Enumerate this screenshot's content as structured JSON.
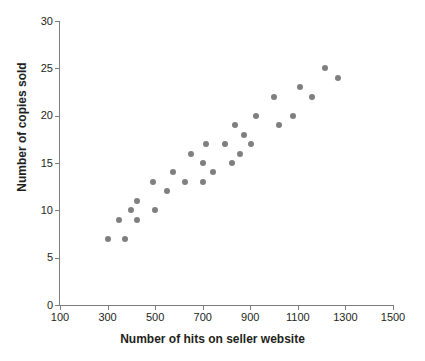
{
  "chart_data": {
    "type": "scatter",
    "title": "",
    "xlabel": "Number of hits on seller website",
    "ylabel": "Number of copies sold",
    "xlim": [
      100,
      1500
    ],
    "ylim": [
      0,
      30
    ],
    "xticks": [
      100,
      300,
      500,
      700,
      900,
      1100,
      1300,
      1500
    ],
    "yticks": [
      0,
      5,
      10,
      15,
      20,
      25,
      30
    ],
    "grid": false,
    "legend": null,
    "marker_color": "#7f7f7f",
    "axis_color": "#7d7d7d",
    "text_color": "#231f20",
    "points": [
      {
        "x": 300,
        "y": 7
      },
      {
        "x": 375,
        "y": 7
      },
      {
        "x": 350,
        "y": 9
      },
      {
        "x": 425,
        "y": 9
      },
      {
        "x": 400,
        "y": 10
      },
      {
        "x": 500,
        "y": 10
      },
      {
        "x": 425,
        "y": 11
      },
      {
        "x": 550,
        "y": 12
      },
      {
        "x": 490,
        "y": 13
      },
      {
        "x": 625,
        "y": 13
      },
      {
        "x": 700,
        "y": 13
      },
      {
        "x": 575,
        "y": 14
      },
      {
        "x": 745,
        "y": 14
      },
      {
        "x": 700,
        "y": 15
      },
      {
        "x": 825,
        "y": 15
      },
      {
        "x": 650,
        "y": 16
      },
      {
        "x": 855,
        "y": 16
      },
      {
        "x": 715,
        "y": 17
      },
      {
        "x": 795,
        "y": 17
      },
      {
        "x": 905,
        "y": 17
      },
      {
        "x": 875,
        "y": 18
      },
      {
        "x": 835,
        "y": 19
      },
      {
        "x": 1020,
        "y": 19
      },
      {
        "x": 925,
        "y": 20
      },
      {
        "x": 1080,
        "y": 20
      },
      {
        "x": 1000,
        "y": 22
      },
      {
        "x": 1160,
        "y": 22
      },
      {
        "x": 1110,
        "y": 23
      },
      {
        "x": 1215,
        "y": 25
      },
      {
        "x": 1270,
        "y": 24
      }
    ]
  }
}
